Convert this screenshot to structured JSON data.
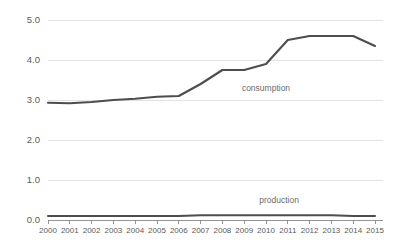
{
  "chart_data": {
    "type": "line",
    "title": "",
    "subtitle": "",
    "xlabel": "",
    "ylabel": "",
    "categories": [
      "2000",
      "2001",
      "2002",
      "2003",
      "2004",
      "2005",
      "2006",
      "2007",
      "2008",
      "2009",
      "2010",
      "2011",
      "2012",
      "2013",
      "2014",
      "2015"
    ],
    "x": [
      2000,
      2001,
      2002,
      2003,
      2004,
      2005,
      2006,
      2007,
      2008,
      2009,
      2010,
      2011,
      2012,
      2013,
      2014,
      2015
    ],
    "series": [
      {
        "name": "consumption",
        "label": "consumption",
        "color": "#4d4d4d",
        "values": [
          2.93,
          2.92,
          2.95,
          3.0,
          3.03,
          3.08,
          3.1,
          3.4,
          3.75,
          3.75,
          3.9,
          4.5,
          4.6,
          4.6,
          4.6,
          4.35
        ]
      },
      {
        "name": "production",
        "label": "production",
        "color": "#4d4d4d",
        "values": [
          0.1,
          0.1,
          0.1,
          0.1,
          0.1,
          0.1,
          0.1,
          0.12,
          0.12,
          0.12,
          0.12,
          0.12,
          0.12,
          0.12,
          0.1,
          0.1
        ]
      }
    ],
    "ylim": [
      0.0,
      5.0
    ],
    "yticks": [
      "0.0",
      "1.0",
      "2.0",
      "3.0",
      "4.0",
      "5.0"
    ],
    "ytick_values": [
      0.0,
      1.0,
      2.0,
      3.0,
      4.0,
      5.0
    ],
    "xlim": [
      2000,
      2015
    ],
    "grid": "horizontal",
    "legend": "inline-annotations",
    "annotations": [
      {
        "text": "consumption",
        "x": 2010.0,
        "y": 3.28
      },
      {
        "text": "production",
        "x": 2010.6,
        "y": 0.47
      }
    ],
    "colors": {
      "line": "#4d4d4d",
      "grid": "#dcdcdc",
      "axis": "#8a8a8a",
      "text": "#5a5a5a",
      "annotation_text": "#6b6b6b",
      "background": "#ffffff"
    }
  }
}
